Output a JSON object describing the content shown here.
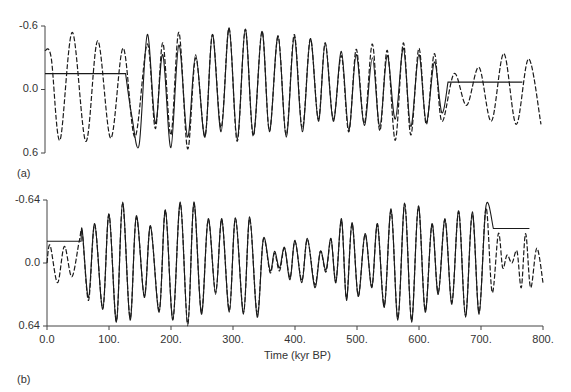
{
  "chart_data": [
    {
      "panel": "(a)",
      "type": "line",
      "title": "",
      "xlabel": "",
      "ylabel": "",
      "xlim": [
        0,
        800
      ],
      "ylim": [
        -0.6,
        0.6
      ],
      "y_inverted": true,
      "y_ticks": [
        "-0.6",
        "0.0",
        "0.6"
      ],
      "x_ticks": [],
      "series": [
        {
          "name": "model (solid)",
          "style": "solid",
          "points": [
            [
              0,
              -0.15
            ],
            [
              130,
              -0.15
            ],
            [
              130,
              -0.15
            ],
            [
              140,
              0.25
            ],
            [
              152,
              0.52
            ],
            [
              165,
              -0.52
            ],
            [
              178,
              0.32
            ],
            [
              190,
              -0.33
            ],
            [
              203,
              0.55
            ],
            [
              216,
              -0.42
            ],
            [
              230,
              0.45
            ],
            [
              243,
              -0.33
            ],
            [
              258,
              0.45
            ],
            [
              270,
              -0.52
            ],
            [
              284,
              0.4
            ],
            [
              297,
              -0.58
            ],
            [
              310,
              0.47
            ],
            [
              323,
              -0.57
            ],
            [
              336,
              0.43
            ],
            [
              350,
              -0.55
            ],
            [
              362,
              0.4
            ],
            [
              376,
              -0.51
            ],
            [
              389,
              0.45
            ],
            [
              402,
              -0.5
            ],
            [
              415,
              0.4
            ],
            [
              428,
              -0.48
            ],
            [
              441,
              0.3
            ],
            [
              452,
              -0.44
            ],
            [
              465,
              0.3
            ],
            [
              478,
              -0.36
            ],
            [
              490,
              0.38
            ],
            [
              502,
              -0.33
            ],
            [
              515,
              0.34
            ],
            [
              528,
              -0.3
            ],
            [
              540,
              0.35
            ],
            [
              552,
              -0.32
            ],
            [
              565,
              0.28
            ],
            [
              578,
              -0.39
            ],
            [
              590,
              0.35
            ],
            [
              603,
              -0.33
            ],
            [
              615,
              0.31
            ],
            [
              628,
              -0.26
            ],
            [
              640,
              0.22
            ],
            [
              650,
              -0.07
            ],
            [
              650,
              -0.07
            ],
            [
              770,
              -0.07
            ]
          ]
        },
        {
          "name": "record (dashed)",
          "style": "dashed",
          "points": [
            [
              0,
              -0.37
            ],
            [
              10,
              -0.3
            ],
            [
              24,
              0.48
            ],
            [
              44,
              -0.54
            ],
            [
              66,
              0.49
            ],
            [
              85,
              -0.46
            ],
            [
              106,
              0.46
            ],
            [
              126,
              -0.39
            ],
            [
              145,
              0.45
            ],
            [
              165,
              -0.43
            ],
            [
              178,
              0.37
            ],
            [
              190,
              -0.44
            ],
            [
              203,
              0.43
            ],
            [
              216,
              -0.54
            ],
            [
              230,
              0.56
            ],
            [
              243,
              -0.3
            ],
            [
              258,
              0.44
            ],
            [
              270,
              -0.52
            ],
            [
              284,
              0.36
            ],
            [
              297,
              -0.58
            ],
            [
              310,
              0.49
            ],
            [
              323,
              -0.57
            ],
            [
              336,
              0.44
            ],
            [
              350,
              -0.55
            ],
            [
              362,
              0.39
            ],
            [
              376,
              -0.5
            ],
            [
              389,
              0.43
            ],
            [
              402,
              -0.52
            ],
            [
              415,
              0.37
            ],
            [
              428,
              -0.48
            ],
            [
              441,
              0.28
            ],
            [
              452,
              -0.44
            ],
            [
              465,
              0.28
            ],
            [
              478,
              -0.32
            ],
            [
              490,
              0.4
            ],
            [
              502,
              -0.38
            ],
            [
              515,
              0.32
            ],
            [
              528,
              -0.43
            ],
            [
              540,
              0.39
            ],
            [
              552,
              -0.37
            ],
            [
              565,
              0.48
            ],
            [
              578,
              -0.44
            ],
            [
              590,
              0.43
            ],
            [
              603,
              -0.39
            ],
            [
              615,
              0.33
            ],
            [
              628,
              -0.34
            ],
            [
              640,
              0.3
            ],
            [
              660,
              -0.15
            ],
            [
              680,
              0.15
            ],
            [
              700,
              -0.21
            ],
            [
              720,
              0.3
            ],
            [
              740,
              -0.34
            ],
            [
              760,
              0.33
            ],
            [
              780,
              -0.29
            ],
            [
              800,
              0.33
            ]
          ]
        }
      ]
    },
    {
      "panel": "(b)",
      "type": "line",
      "title": "",
      "xlabel": "Time (kyr BP)",
      "ylabel": "",
      "xlim": [
        0,
        800
      ],
      "ylim": [
        -0.64,
        0.64
      ],
      "y_inverted": true,
      "y_ticks": [
        "-0.64",
        "0.0",
        "0.64"
      ],
      "x_ticks": [
        "0.0",
        "100.",
        "200.",
        "300.",
        "400.",
        "500.",
        "600.",
        "700.",
        "800."
      ],
      "series": [
        {
          "name": "model (solid)",
          "style": "solid",
          "points": [
            [
              0,
              -0.22
            ],
            [
              55,
              -0.22
            ],
            [
              55,
              -0.22
            ],
            [
              57,
              -0.33
            ],
            [
              67,
              0.35
            ],
            [
              77,
              -0.4
            ],
            [
              90,
              0.47
            ],
            [
              100,
              -0.5
            ],
            [
              112,
              0.6
            ],
            [
              122,
              -0.62
            ],
            [
              134,
              0.58
            ],
            [
              144,
              -0.48
            ],
            [
              157,
              0.35
            ],
            [
              167,
              -0.38
            ],
            [
              181,
              0.5
            ],
            [
              191,
              -0.54
            ],
            [
              203,
              0.58
            ],
            [
              215,
              -0.62
            ],
            [
              227,
              0.64
            ],
            [
              237,
              -0.62
            ],
            [
              249,
              0.52
            ],
            [
              260,
              -0.45
            ],
            [
              272,
              0.32
            ],
            [
              282,
              -0.45
            ],
            [
              294,
              0.5
            ],
            [
              304,
              -0.46
            ],
            [
              317,
              0.52
            ],
            [
              327,
              -0.47
            ],
            [
              339,
              0.55
            ],
            [
              349,
              -0.25
            ],
            [
              360,
              0.08
            ],
            [
              367,
              -0.12
            ],
            [
              375,
              0.05
            ],
            [
              383,
              -0.16
            ],
            [
              392,
              0.17
            ],
            [
              400,
              -0.23
            ],
            [
              411,
              0.2
            ],
            [
              420,
              -0.25
            ],
            [
              432,
              0.25
            ],
            [
              441,
              -0.12
            ],
            [
              450,
              0.07
            ],
            [
              458,
              -0.25
            ],
            [
              466,
              0.2
            ],
            [
              475,
              -0.45
            ],
            [
              483,
              0.38
            ],
            [
              492,
              -0.41
            ],
            [
              502,
              0.34
            ],
            [
              513,
              -0.3
            ],
            [
              524,
              0.25
            ],
            [
              533,
              -0.4
            ],
            [
              544,
              0.45
            ],
            [
              555,
              -0.55
            ],
            [
              566,
              0.58
            ],
            [
              577,
              -0.61
            ],
            [
              588,
              0.6
            ],
            [
              599,
              -0.58
            ],
            [
              610,
              0.5
            ],
            [
              621,
              -0.4
            ],
            [
              631,
              0.32
            ],
            [
              642,
              -0.45
            ],
            [
              653,
              0.42
            ],
            [
              664,
              -0.53
            ],
            [
              675,
              0.55
            ],
            [
              686,
              -0.52
            ],
            [
              697,
              0.52
            ],
            [
              708,
              -0.58
            ],
            [
              720,
              -0.35
            ],
            [
              720,
              -0.35
            ],
            [
              778,
              -0.35
            ]
          ]
        },
        {
          "name": "record (dashed)",
          "style": "dashed",
          "points": [
            [
              0,
              0.0
            ],
            [
              5,
              -0.18
            ],
            [
              17,
              0.2
            ],
            [
              28,
              -0.17
            ],
            [
              40,
              0.14
            ],
            [
              52,
              -0.22
            ],
            [
              57,
              -0.3
            ],
            [
              67,
              0.38
            ],
            [
              77,
              -0.39
            ],
            [
              90,
              0.46
            ],
            [
              100,
              -0.49
            ],
            [
              112,
              0.59
            ],
            [
              122,
              -0.6
            ],
            [
              134,
              0.56
            ],
            [
              144,
              -0.46
            ],
            [
              157,
              0.33
            ],
            [
              167,
              -0.37
            ],
            [
              181,
              0.48
            ],
            [
              191,
              -0.53
            ],
            [
              203,
              0.57
            ],
            [
              215,
              -0.6
            ],
            [
              227,
              0.62
            ],
            [
              237,
              -0.6
            ],
            [
              249,
              0.5
            ],
            [
              260,
              -0.44
            ],
            [
              272,
              0.3
            ],
            [
              282,
              -0.44
            ],
            [
              294,
              0.48
            ],
            [
              304,
              -0.45
            ],
            [
              317,
              0.5
            ],
            [
              327,
              -0.45
            ],
            [
              339,
              0.52
            ],
            [
              349,
              -0.24
            ],
            [
              360,
              0.1
            ],
            [
              367,
              -0.1
            ],
            [
              375,
              0.08
            ],
            [
              383,
              -0.15
            ],
            [
              392,
              0.15
            ],
            [
              400,
              -0.22
            ],
            [
              411,
              0.18
            ],
            [
              420,
              -0.24
            ],
            [
              432,
              0.22
            ],
            [
              441,
              -0.12
            ],
            [
              450,
              0.09
            ],
            [
              458,
              -0.24
            ],
            [
              466,
              0.18
            ],
            [
              475,
              -0.43
            ],
            [
              483,
              0.36
            ],
            [
              492,
              -0.4
            ],
            [
              502,
              0.33
            ],
            [
              513,
              -0.29
            ],
            [
              524,
              0.24
            ],
            [
              533,
              -0.39
            ],
            [
              544,
              0.43
            ],
            [
              555,
              -0.53
            ],
            [
              566,
              0.56
            ],
            [
              577,
              -0.6
            ],
            [
              588,
              0.58
            ],
            [
              599,
              -0.57
            ],
            [
              610,
              0.48
            ],
            [
              621,
              -0.39
            ],
            [
              631,
              0.3
            ],
            [
              642,
              -0.44
            ],
            [
              653,
              0.4
            ],
            [
              664,
              -0.52
            ],
            [
              675,
              0.53
            ],
            [
              686,
              -0.5
            ],
            [
              697,
              0.5
            ],
            [
              708,
              -0.56
            ],
            [
              718,
              0.3
            ],
            [
              728,
              -0.3
            ],
            [
              735,
              0.05
            ],
            [
              742,
              -0.08
            ],
            [
              750,
              0.0
            ],
            [
              758,
              -0.12
            ],
            [
              765,
              0.25
            ],
            [
              772,
              -0.3
            ],
            [
              780,
              0.25
            ],
            [
              790,
              -0.15
            ],
            [
              800,
              0.2
            ]
          ]
        }
      ]
    }
  ],
  "panels": {
    "a": {
      "label": "(a)",
      "y_ticks": [
        {
          "text": "-0.6",
          "value": -0.6
        },
        {
          "text": "0.0",
          "value": 0.0
        },
        {
          "text": "0.6",
          "value": 0.6
        }
      ]
    },
    "b": {
      "label": "(b)",
      "y_ticks": [
        {
          "text": "-0.64",
          "value": -0.64
        },
        {
          "text": "0.0",
          "value": 0.0
        },
        {
          "text": "0.64",
          "value": 0.64
        }
      ],
      "x_ticks": [
        "0.0",
        "100.",
        "200.",
        "300.",
        "400.",
        "500.",
        "600.",
        "700.",
        "800."
      ],
      "xlabel": "Time (kyr BP)"
    }
  },
  "colors": {
    "line": "#1a1a1a",
    "axis": "#444444",
    "background": "#ffffff"
  }
}
